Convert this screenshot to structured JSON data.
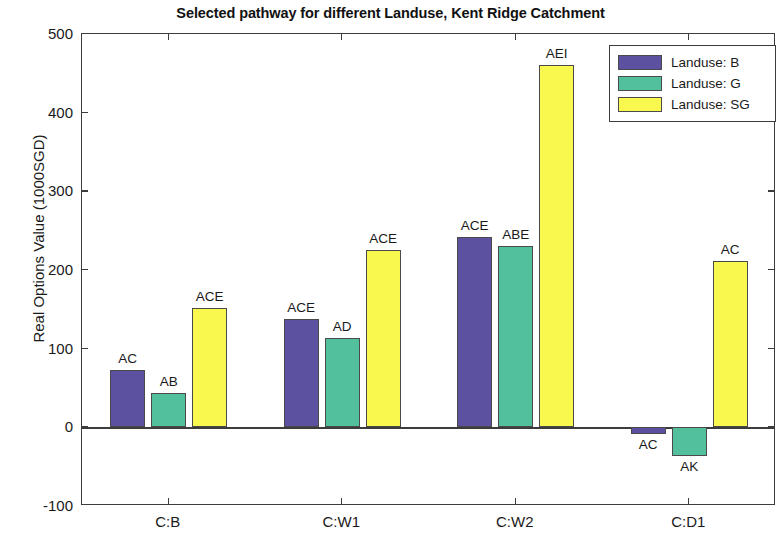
{
  "chart_data": {
    "type": "bar",
    "title": "Selected pathway for different Landuse, Kent Ridge Catchment",
    "xlabel": "",
    "ylabel": "Real Options Value (1000SGD)",
    "categories": [
      "C:B",
      "C:W1",
      "C:W2",
      "C:D1"
    ],
    "ylim": [
      -100,
      500
    ],
    "yticks": [
      -100,
      0,
      100,
      200,
      300,
      400,
      500
    ],
    "ytick_labels": [
      "-100",
      "0",
      "100",
      "200",
      "300",
      "400",
      "500"
    ],
    "grid": false,
    "legend_position": "top-right",
    "series": [
      {
        "name": "Landuse: B",
        "color": "#5b51a0",
        "values": [
          73,
          138,
          242,
          -9
        ],
        "point_labels": [
          "AC",
          "ACE",
          "ACE",
          "AC"
        ]
      },
      {
        "name": "Landuse: G",
        "color": "#52bf9d",
        "values": [
          44,
          113,
          230,
          -37
        ],
        "point_labels": [
          "AB",
          "AD",
          "ABE",
          "AK"
        ]
      },
      {
        "name": "Landuse: SG",
        "color": "#f9f84e",
        "values": [
          152,
          225,
          460,
          212
        ],
        "point_labels": [
          "ACE",
          "ACE",
          "AEI",
          "AC"
        ]
      }
    ]
  },
  "legend": {
    "items": [
      {
        "label": "Landuse: B"
      },
      {
        "label": "Landuse: G"
      },
      {
        "label": "Landuse: SG"
      }
    ]
  },
  "colors": {
    "series_b": "#5b51a0",
    "series_g": "#52bf9d",
    "series_sg": "#f9f84e",
    "axis": "#3c3c3c",
    "background": "#ffffff"
  }
}
